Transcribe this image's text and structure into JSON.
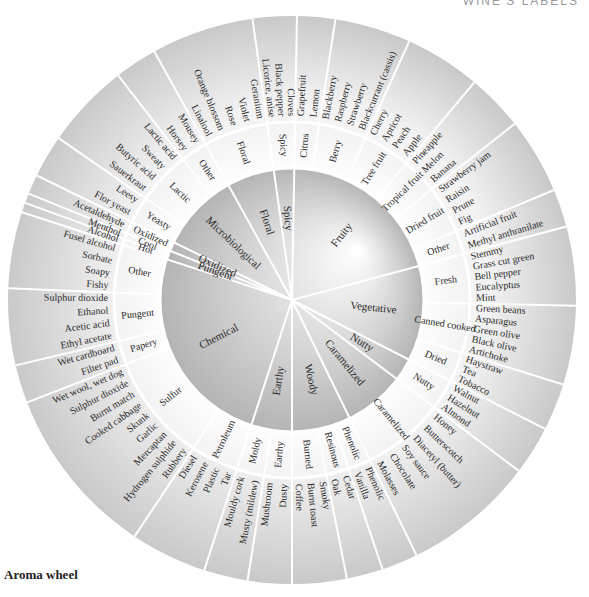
{
  "header": {
    "label": "WINE'S LABELS"
  },
  "caption": "Aroma wheel",
  "wheel": {
    "center": [
      292,
      300
    ],
    "radii": {
      "inner": 132,
      "middle": 178,
      "outer": 284
    },
    "categories": [
      {
        "name": "Spicy",
        "start": -98,
        "end": -89,
        "subs": [
          {
            "name": "Spicy",
            "terms": [
              "Licorice, anise",
              "Black pepper",
              "Cloves"
            ]
          }
        ]
      },
      {
        "name": "Fruity",
        "start": -89,
        "end": -15,
        "subs": [
          {
            "name": "Citrus",
            "terms": [
              "Grapefruit",
              "Lemon"
            ]
          },
          {
            "name": "Berry",
            "terms": [
              "Blackberry",
              "Raspberry",
              "Strawberry",
              "Blackcurrant (cassis)"
            ]
          },
          {
            "name": "Tree fruit",
            "terms": [
              "Cherry",
              "Apricot",
              "Peach",
              "Apple"
            ]
          },
          {
            "name": "Tropical fruit",
            "terms": [
              "Pineapple",
              "Melon",
              "Banana"
            ]
          },
          {
            "name": "Dried fruit",
            "terms": [
              "Strawberry jam",
              "Raisin",
              "Prune",
              "Fig"
            ]
          },
          {
            "name": "Other",
            "terms": [
              "Artificial fruit",
              "Methyl anthranilate"
            ]
          }
        ]
      },
      {
        "name": "Vegetative",
        "start": -15,
        "end": 27,
        "subs": [
          {
            "name": "Fresh",
            "terms": [
              "Stemmy",
              "Grass cut green",
              "Bell pepper",
              "Eucalyptus",
              "Mint"
            ]
          },
          {
            "name": "Canned cooked",
            "terms": [
              "Green beans",
              "Asparagus",
              "Green olive",
              "Black olive",
              "Artichoke"
            ]
          },
          {
            "name": "Dried",
            "terms": [
              "Haystraw",
              "Tea",
              "Tobacco"
            ]
          }
        ]
      },
      {
        "name": "Nutty",
        "start": 27,
        "end": 37,
        "subs": [
          {
            "name": "Nutty",
            "terms": [
              "Walnut",
              "Hazelnut",
              "Almond"
            ]
          }
        ]
      },
      {
        "name": "Caramelized",
        "start": 37,
        "end": 64,
        "subs": [
          {
            "name": "Caramelized",
            "terms": [
              "Honey",
              "Butterscotch",
              "Diacetyl (butter)",
              "Soy sauce",
              "Chocolate",
              "Molasses"
            ]
          }
        ]
      },
      {
        "name": "Woody",
        "start": 64,
        "end": 90,
        "subs": [
          {
            "name": "Phenolic",
            "terms": [
              "Phenolic",
              "Vanilla"
            ]
          },
          {
            "name": "Resinous",
            "terms": [
              "Cedar",
              "Oak"
            ]
          },
          {
            "name": "Burned",
            "terms": [
              "Smoky",
              "Burnt toast",
              "Coffee"
            ]
          }
        ]
      },
      {
        "name": "Earthy",
        "start": 90,
        "end": 108,
        "subs": [
          {
            "name": "Earthy",
            "terms": [
              "Dusty",
              "Mushroom"
            ]
          },
          {
            "name": "Moldy",
            "terms": [
              "Musty (mildew)",
              "Mouldy cork"
            ]
          }
        ]
      },
      {
        "name": "Chemical",
        "start": 108,
        "end": 198,
        "subs": [
          {
            "name": "Petroleum",
            "terms": [
              "Tar",
              "Plastic",
              "Kerosene",
              "Diesel"
            ]
          },
          {
            "name": "Sulfur",
            "terms": [
              "Rubbery",
              "Hydrogen sulphide",
              "Mercaptan",
              "Garlic",
              "Skunk",
              "Cooked cabbage",
              "Burnt match",
              "Sulphur dioxide",
              "Wet wool, wet dog"
            ]
          },
          {
            "name": "Papery",
            "terms": [
              "Filter pad",
              "Wet cardboard"
            ]
          },
          {
            "name": "Pungent",
            "terms": [
              "Ethyl acetate",
              "Acetic acid",
              "Ethanol",
              "Sulphur dioxide"
            ]
          },
          {
            "name": "Other",
            "terms": [
              "Fishy",
              "Soapy",
              "Sorbate",
              "Fusel alcohol"
            ]
          }
        ]
      },
      {
        "name": "Pungent",
        "start": 198,
        "end": 202,
        "subs": [
          {
            "name": "Hot",
            "terms": [
              "Alcohol"
            ]
          },
          {
            "name": "Cool",
            "terms": [
              "Menthol"
            ]
          }
        ]
      },
      {
        "name": "Oxidized",
        "start": 202,
        "end": 206,
        "subs": [
          {
            "name": "Oxidized",
            "terms": [
              "Acetaldehyde"
            ]
          }
        ]
      },
      {
        "name": "Microbiological",
        "start": 206,
        "end": 241,
        "subs": [
          {
            "name": "Yeasty",
            "terms": [
              "Flor yeast",
              "Leesy"
            ]
          },
          {
            "name": "Lactic",
            "terms": [
              "Sauerkraut",
              "Butyric acid",
              "Sweaty",
              "Lactic acid"
            ]
          },
          {
            "name": "Other",
            "terms": [
              "Horsey",
              "Mousey"
            ]
          }
        ]
      },
      {
        "name": "Floral",
        "start": 241,
        "end": 262,
        "subs": [
          {
            "name": "Floral",
            "terms": [
              "Linalool",
              "Orange blossom",
              "Rose",
              "Violet",
              "Geranium"
            ]
          }
        ]
      }
    ]
  }
}
